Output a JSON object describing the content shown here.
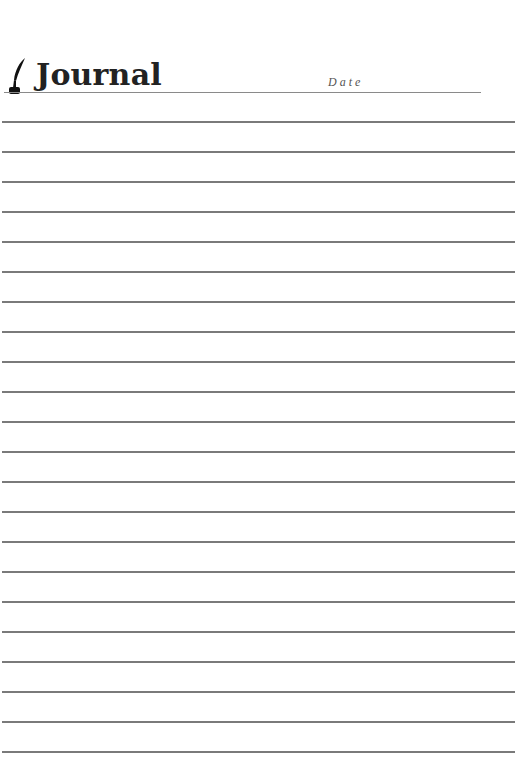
{
  "header": {
    "icon": "quill-pen-icon",
    "title": "Journal",
    "date_label": "Date"
  },
  "ruled_lines": {
    "count": 22,
    "start_y": 121,
    "spacing": 30,
    "color": "#7a7a7a"
  },
  "colors": {
    "title": "#222222",
    "date_label": "#555555",
    "header_rule": "#8a8a8a",
    "background": "#ffffff"
  }
}
